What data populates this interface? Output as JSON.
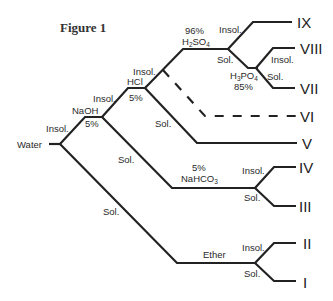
{
  "figure": {
    "title": "Figure 1",
    "start": "Water",
    "nodes": {
      "naoh": {
        "top": "NaOH",
        "bottom": "5%"
      },
      "hcl": {
        "top": "HCl",
        "bottom": "5%"
      },
      "h2so4": {
        "top": "96%",
        "bottom_main": "H",
        "bottom_sub1": "2",
        "bottom_mid": "SO",
        "bottom_sub2": "4"
      },
      "h3po4": {
        "top_main": "H",
        "top_sub1": "3",
        "top_mid": "PO",
        "top_sub2": "4",
        "bottom": "85%"
      },
      "nahco3": {
        "top": "5%",
        "bottom_main": "NaHCO",
        "bottom_sub": "3"
      },
      "ether": {
        "label": "Ether"
      }
    },
    "branch_labels": {
      "water_insol": "Insol.",
      "water_sol": "Sol.",
      "naoh_insol": "Insol.",
      "naoh_sol": "Sol.",
      "hcl_insol": "Insol.",
      "hcl_sol": "Sol.",
      "h2so4_insol": "Insol.",
      "h2so4_sol": "Sol.",
      "h3po4_insol": "Insol.",
      "h3po4_sol": "Sol.",
      "nahco3_insol": "Insol.",
      "nahco3_sol": "Sol.",
      "ether_insol": "Insol.",
      "ether_sol": "Sol."
    },
    "classes": [
      "I",
      "II",
      "III",
      "IV",
      "V",
      "VI",
      "VII",
      "VIII",
      "IX"
    ]
  }
}
